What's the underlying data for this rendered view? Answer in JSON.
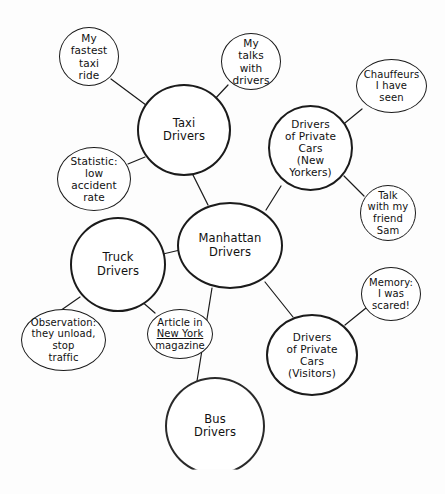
{
  "diagram": {
    "background_color": "#fdfdfd",
    "stroke_color": "#1b1b1b",
    "text_color": "#111111"
  },
  "nodes": [
    {
      "id": "my-fastest-taxi-ride",
      "name": "node-my-fastest-taxi-ride",
      "text": "My\nfastest\ntaxi\nride",
      "lines": [
        "My",
        "fastest",
        "taxi",
        "ride"
      ],
      "kind": "leaf",
      "x": 59,
      "y": 27,
      "w": 60,
      "h": 59,
      "font_size": 10.5
    },
    {
      "id": "my-talks-with-drivers",
      "name": "node-my-talks-with-drivers",
      "text": "My\ntalks\nwith\ndrivers",
      "lines": [
        "My",
        "talks",
        "with",
        "drivers"
      ],
      "kind": "leaf",
      "x": 221,
      "y": 33,
      "w": 60,
      "h": 57,
      "font_size": 10.5
    },
    {
      "id": "chauffeurs-i-have-seen",
      "name": "node-chauffeurs-i-have-seen",
      "text": "Chauffeurs\nI have\nseen",
      "lines": [
        "Chauffeurs",
        "I have",
        "seen"
      ],
      "kind": "leaf",
      "x": 356,
      "y": 59,
      "w": 71,
      "h": 54,
      "font_size": 10
    },
    {
      "id": "taxi-drivers",
      "name": "node-taxi-drivers",
      "text": "Taxi\nDrivers",
      "lines": [
        "Taxi",
        "Drivers"
      ],
      "kind": "hub",
      "x": 137,
      "y": 84,
      "w": 94,
      "h": 92,
      "font_size": 11.5
    },
    {
      "id": "drivers-private-cars-new-yorkers",
      "name": "node-drivers-of-private-cars-new-yorkers",
      "text": "Drivers\nof Private\nCars\n(New\nYorkers)",
      "lines": [
        "Drivers",
        "of Private",
        "Cars",
        "(New",
        "Yorkers)"
      ],
      "kind": "hub",
      "x": 268,
      "y": 105,
      "w": 85,
      "h": 86,
      "font_size": 10.5
    },
    {
      "id": "statistic-low-accident-rate",
      "name": "node-statistic-low-accident-rate",
      "text": "Statistic:\nlow\naccident\nrate",
      "lines": [
        "Statistic:",
        "low",
        "accident",
        "rate"
      ],
      "kind": "leaf",
      "x": 57,
      "y": 147,
      "w": 74,
      "h": 64,
      "font_size": 10.5
    },
    {
      "id": "talk-with-my-friend-sam",
      "name": "node-talk-with-my-friend-sam",
      "text": "Talk\nwith my\nfriend\nSam",
      "lines": [
        "Talk",
        "with my",
        "friend",
        "Sam"
      ],
      "kind": "leaf",
      "x": 360,
      "y": 185,
      "w": 56,
      "h": 56,
      "font_size": 10
    },
    {
      "id": "manhattan-drivers",
      "name": "node-manhattan-drivers",
      "text": "Manhattan\nDrivers",
      "lines": [
        "Manhattan",
        "Drivers"
      ],
      "kind": "hub",
      "x": 177,
      "y": 202,
      "w": 106,
      "h": 87,
      "font_size": 11.5
    },
    {
      "id": "truck-drivers",
      "name": "node-truck-drivers",
      "text": "Truck\nDrivers",
      "lines": [
        "Truck",
        "Drivers"
      ],
      "kind": "hub",
      "x": 70,
      "y": 217,
      "w": 96,
      "h": 95,
      "font_size": 11.5
    },
    {
      "id": "memory-i-was-scared",
      "name": "node-memory-i-was-scared",
      "text": "Memory:\nI was\nscared!",
      "lines": [
        "Memory:",
        "I was",
        "scared!"
      ],
      "kind": "leaf",
      "x": 361,
      "y": 267,
      "w": 60,
      "h": 54,
      "font_size": 10
    },
    {
      "id": "observation-they-unload",
      "name": "node-observation-they-unload-stop-traffic",
      "text": "Observation:\nthey unload,\nstop\ntraffic",
      "lines": [
        "Observation:",
        "they unload,",
        "stop",
        "traffic"
      ],
      "kind": "leaf",
      "x": 21,
      "y": 309,
      "w": 85,
      "h": 62,
      "font_size": 10
    },
    {
      "id": "article-new-york-magazine",
      "name": "node-article-in-new-york-magazine",
      "text": "Article in New York magazine",
      "lines": [
        "Article in",
        "New York",
        "magazine"
      ],
      "underline_line_index": 1,
      "kind": "leaf",
      "x": 147,
      "y": 309,
      "w": 66,
      "h": 50,
      "font_size": 10
    },
    {
      "id": "drivers-private-cars-visitors",
      "name": "node-drivers-of-private-cars-visitors",
      "text": "Drivers\nof Private\nCars\n(Visitors)",
      "lines": [
        "Drivers",
        "of Private",
        "Cars",
        "(Visitors)"
      ],
      "kind": "hub",
      "x": 266,
      "y": 314,
      "w": 92,
      "h": 82,
      "font_size": 10.5
    },
    {
      "id": "bus-drivers",
      "name": "node-bus-drivers",
      "text": "Bus\nDrivers",
      "lines": [
        "Bus",
        "Drivers"
      ],
      "kind": "hub",
      "faded_bottom": true,
      "x": 165,
      "y": 377,
      "w": 100,
      "h": 98,
      "font_size": 11.5
    }
  ],
  "edges": [
    {
      "name": "edge-taxi-to-my-fastest-taxi-ride",
      "from": "my-fastest-taxi-ride",
      "to": "taxi-drivers",
      "x1": 111,
      "y1": 79,
      "x2": 150,
      "y2": 108
    },
    {
      "name": "edge-taxi-to-my-talks-with-drivers",
      "from": "my-talks-with-drivers",
      "to": "taxi-drivers",
      "x1": 228,
      "y1": 85,
      "x2": 213,
      "y2": 101
    },
    {
      "name": "edge-taxi-to-statistic",
      "from": "statistic-low-accident-rate",
      "to": "taxi-drivers",
      "x1": 128,
      "y1": 164,
      "x2": 145,
      "y2": 157
    },
    {
      "name": "edge-taxi-to-manhattan",
      "from": "taxi-drivers",
      "to": "manhattan-drivers",
      "x1": 192,
      "y1": 173,
      "x2": 208,
      "y2": 205
    },
    {
      "name": "edge-nyprivate-to-chauffeurs",
      "from": "chauffeurs-i-have-seen",
      "to": "drivers-private-cars-new-yorkers",
      "x1": 362,
      "y1": 109,
      "x2": 340,
      "y2": 127
    },
    {
      "name": "edge-nyprivate-to-talk-sam",
      "from": "talk-with-my-friend-sam",
      "to": "drivers-private-cars-new-yorkers",
      "x1": 364,
      "y1": 196,
      "x2": 344,
      "y2": 176
    },
    {
      "name": "edge-nyprivate-to-manhattan",
      "from": "drivers-private-cars-new-yorkers",
      "to": "manhattan-drivers",
      "x1": 281,
      "y1": 186,
      "x2": 266,
      "y2": 210
    },
    {
      "name": "edge-truck-to-manhattan",
      "from": "truck-drivers",
      "to": "manhattan-drivers",
      "x1": 163,
      "y1": 254,
      "x2": 180,
      "y2": 250
    },
    {
      "name": "edge-truck-to-observation",
      "from": "observation-they-unload",
      "to": "truck-drivers",
      "x1": 57,
      "y1": 313,
      "x2": 80,
      "y2": 297
    },
    {
      "name": "edge-truck-to-article",
      "from": "article-new-york-magazine",
      "to": "truck-drivers",
      "x1": 155,
      "y1": 313,
      "x2": 140,
      "y2": 300
    },
    {
      "name": "edge-manhattan-to-bus",
      "from": "manhattan-drivers",
      "to": "bus-drivers",
      "x1": 212,
      "y1": 288,
      "x2": 197,
      "y2": 381
    },
    {
      "name": "edge-manhattan-to-visitors",
      "from": "manhattan-drivers",
      "to": "drivers-private-cars-visitors",
      "x1": 265,
      "y1": 282,
      "x2": 293,
      "y2": 317
    },
    {
      "name": "edge-visitors-to-memory",
      "from": "drivers-private-cars-visitors",
      "to": "memory-i-was-scared",
      "x1": 345,
      "y1": 325,
      "x2": 366,
      "y2": 308
    }
  ]
}
